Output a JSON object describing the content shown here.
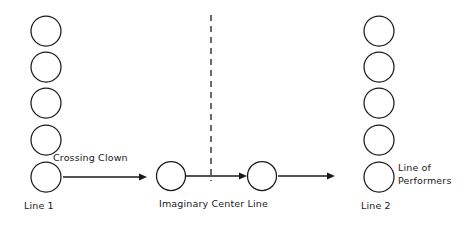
{
  "diagram": {
    "type": "stage-blocking-diagram",
    "colors": {
      "stroke": "#1a1a1a",
      "background": "#ffffff",
      "text": "#1a1a1a"
    },
    "labels": {
      "crossing_clown": "Crossing Clown",
      "line_1": "Line 1",
      "imaginary_center_line": "Imaginary Center Line",
      "line_2": "Line 2",
      "line_of_performers": "Line of\nPerformers"
    },
    "groups": {
      "left_line": {
        "name": "Line 1",
        "count": 5,
        "circles": [
          {
            "cx": 46,
            "cy": 31,
            "r": 15
          },
          {
            "cx": 46,
            "cy": 67,
            "r": 15
          },
          {
            "cx": 46,
            "cy": 103,
            "r": 15
          },
          {
            "cx": 46,
            "cy": 140,
            "r": 15
          },
          {
            "cx": 46,
            "cy": 177,
            "r": 15
          }
        ]
      },
      "center_performers": {
        "name": "Crossing Clown positions",
        "count": 2,
        "circles": [
          {
            "cx": 171,
            "cy": 176,
            "r": 14.5
          },
          {
            "cx": 262,
            "cy": 176,
            "r": 14.5
          }
        ]
      },
      "right_line": {
        "name": "Line 2",
        "count": 5,
        "circles": [
          {
            "cx": 379,
            "cy": 31,
            "r": 15
          },
          {
            "cx": 379,
            "cy": 67,
            "r": 15
          },
          {
            "cx": 379,
            "cy": 103,
            "r": 15
          },
          {
            "cx": 379,
            "cy": 140,
            "r": 15
          },
          {
            "cx": 379,
            "cy": 177,
            "r": 15
          }
        ]
      }
    },
    "center_line": {
      "name": "Imaginary Center Line",
      "x": 211,
      "y_top": 15,
      "y_bottom": 181,
      "style": "dashed"
    },
    "arrows": [
      {
        "name": "arrow-line1-to-center",
        "x1": 63,
        "y1": 177,
        "x2": 147,
        "y2": 177
      },
      {
        "name": "arrow-center-short",
        "x1": 186,
        "y1": 176,
        "x2": 247,
        "y2": 176
      },
      {
        "name": "arrow-center-to-line2",
        "x1": 278,
        "y1": 176,
        "x2": 335,
        "y2": 176
      }
    ]
  }
}
